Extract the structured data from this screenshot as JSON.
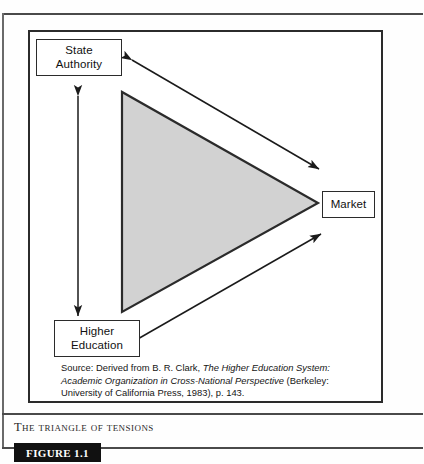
{
  "figure": {
    "tag": "FIGURE 1.1",
    "caption": "The Triangle of Tensions",
    "source_note": {
      "prefix": "Source: Derived from B. R. Clark, ",
      "italic_title": "The Higher Education System: Academic Organization in Cross-National Perspective",
      "suffix": " (Berkeley: University of California Press, 1983),  p. 143."
    }
  },
  "diagram": {
    "type": "triangle-of-tensions",
    "shape": {
      "name": "shaded-triangle",
      "orientation": "points-right",
      "fill_color": "#d2d2d2",
      "stroke_color": "#2b2b2b",
      "vertices": [
        {
          "label": "top-left",
          "x": 122,
          "y": 92
        },
        {
          "label": "bottom-left",
          "x": 122,
          "y": 312
        },
        {
          "label": "right-apex",
          "x": 318,
          "y": 203
        }
      ]
    },
    "nodes": [
      {
        "id": "state-authority",
        "lines": [
          "State",
          "Authority"
        ],
        "position": "top-left"
      },
      {
        "id": "market",
        "lines": [
          "Market"
        ],
        "position": "right"
      },
      {
        "id": "higher-education",
        "lines": [
          "Higher",
          "Education"
        ],
        "position": "bottom-left"
      }
    ],
    "arrows": [
      {
        "id": "state-authority-to-market",
        "style": "double-headed",
        "from": "state-authority",
        "to": "market",
        "color": "#1a1a1a"
      },
      {
        "id": "state-authority-to-higher-education",
        "style": "double-headed",
        "from": "state-authority",
        "to": "higher-education",
        "color": "#1a1a1a"
      },
      {
        "id": "higher-education-to-market",
        "style": "double-headed",
        "from": "higher-education",
        "to": "market",
        "color": "#1a1a1a"
      }
    ]
  }
}
